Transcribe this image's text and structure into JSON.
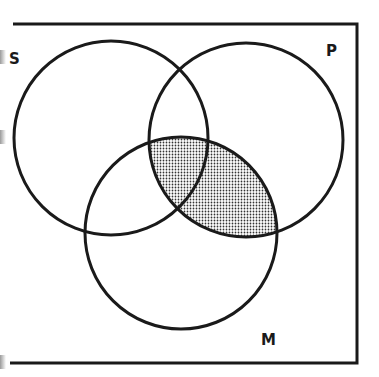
{
  "diagram": {
    "type": "venn",
    "sets": [
      {
        "name": "S",
        "label": "S",
        "cx": 111,
        "cy": 138,
        "r": 97,
        "label_x": 9,
        "label_y": 64
      },
      {
        "name": "P",
        "label": "P",
        "cx": 246,
        "cy": 140,
        "r": 97,
        "label_x": 326,
        "label_y": 56
      },
      {
        "name": "M",
        "label": "M",
        "cx": 181,
        "cy": 233,
        "r": 96,
        "label_x": 261,
        "label_y": 345
      }
    ],
    "shaded_region": "P ∩ M",
    "colors": {
      "stroke": "#1a1a1a",
      "background": "#ffffff",
      "shade_dot": "#333333"
    }
  }
}
